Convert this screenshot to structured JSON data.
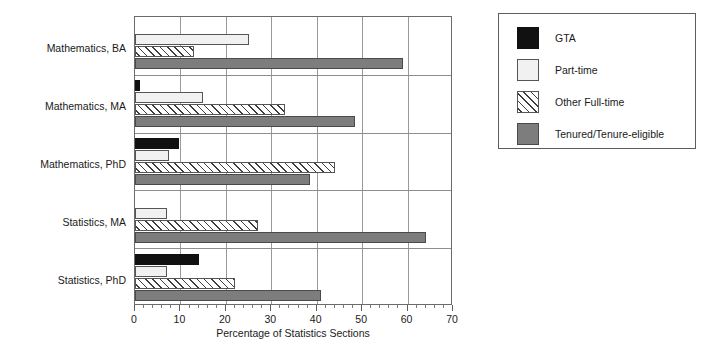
{
  "chart_data": {
    "type": "bar",
    "orientation": "horizontal",
    "title": "",
    "xlabel": "Percentage of Statistics Sections",
    "ylabel": "",
    "xlim": [
      0,
      70
    ],
    "xticks": [
      0,
      10,
      20,
      30,
      40,
      50,
      60,
      70
    ],
    "xticklabels": [
      "0",
      "10",
      "20",
      "30",
      "40",
      "50",
      "60",
      "70"
    ],
    "minor_tick_interval": 2,
    "grid": "vertical",
    "legend_position": "right-outside",
    "categories": [
      "Mathematics, BA",
      "Mathematics, MA",
      "Mathematics, PhD",
      "Statistics, MA",
      "Statistics, PhD"
    ],
    "series": [
      {
        "name": "GTA",
        "color": "#111111",
        "fill": "solid-black",
        "values": [
          0,
          1,
          9.7,
          0,
          14
        ]
      },
      {
        "name": "Part-time",
        "color": "#f1f1f1",
        "fill": "solid-light",
        "values": [
          25,
          15,
          7.5,
          7,
          7
        ]
      },
      {
        "name": "Other Full-time",
        "color": "#ffffff",
        "fill": "diagonal-hatch",
        "values": [
          13,
          33,
          44,
          27,
          22
        ]
      },
      {
        "name": "Tenured/Tenure-eligible",
        "color": "#7d7d7d",
        "fill": "solid-gray",
        "values": [
          59,
          48.5,
          38.5,
          64,
          41
        ]
      }
    ]
  },
  "legend": {
    "items": [
      {
        "label": "GTA",
        "swatch": "gta"
      },
      {
        "label": "Part-time",
        "swatch": "part"
      },
      {
        "label": "Other Full-time",
        "swatch": "other"
      },
      {
        "label": "Tenured/Tenure-eligible",
        "swatch": "tenured"
      }
    ]
  }
}
